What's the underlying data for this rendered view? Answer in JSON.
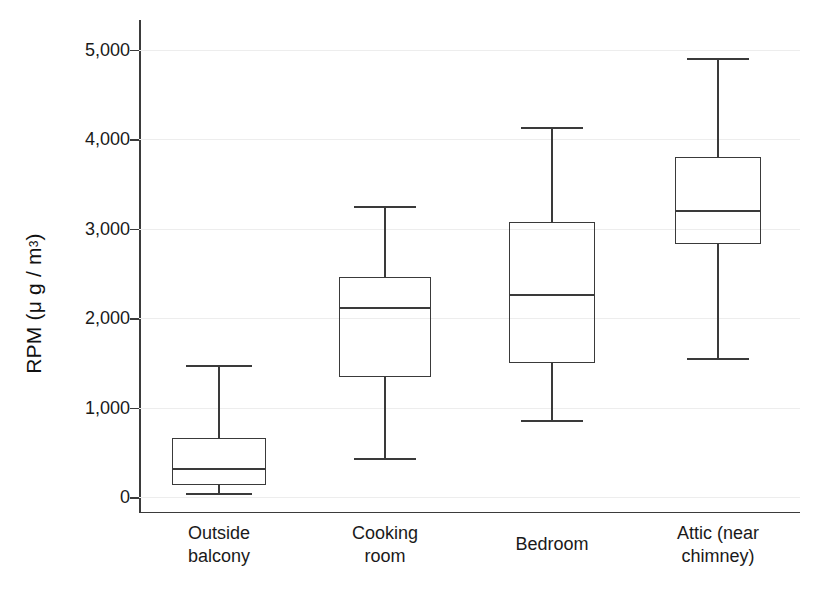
{
  "chart_data": {
    "type": "box",
    "title": "",
    "xlabel": "",
    "ylabel": "RPM (μ g / m",
    "ylabel_exponent": "3",
    "ylabel_tail": ")",
    "ylim": [
      0,
      5200
    ],
    "grid": true,
    "legend": "none",
    "yticks": [
      0,
      1000,
      2000,
      3000,
      4000,
      5000
    ],
    "ytick_labels": [
      "0",
      "1,000",
      "2,000",
      "3,000",
      "4,000",
      "5,000"
    ],
    "categories": [
      "Outside balcony",
      "Cooking room",
      "Bedroom",
      "Attic (near chimney)"
    ],
    "category_label_lines": [
      [
        "Outside",
        "balcony"
      ],
      [
        "Cooking",
        "room"
      ],
      [
        "Bedroom"
      ],
      [
        "Attic (near",
        "chimney)"
      ]
    ],
    "boxes": [
      {
        "category": "Outside balcony",
        "whisker_low": 45,
        "q1": 135,
        "median": 325,
        "q3": 660,
        "whisker_high": 1475
      },
      {
        "category": "Cooking room",
        "whisker_low": 435,
        "q1": 1340,
        "median": 2120,
        "q3": 2460,
        "whisker_high": 3250
      },
      {
        "category": "Bedroom",
        "whisker_low": 860,
        "q1": 1500,
        "median": 2270,
        "q3": 3070,
        "whisker_high": 4130
      },
      {
        "category": "Attic (near chimney)",
        "whisker_low": 1555,
        "q1": 2830,
        "median": 3210,
        "q3": 3800,
        "whisker_high": 4900
      }
    ],
    "colors": {
      "line": "#3a3a3a",
      "grid": "#ededed",
      "axis": "#3b3b3b",
      "text": "#1a1a1a",
      "background": "#ffffff"
    }
  }
}
